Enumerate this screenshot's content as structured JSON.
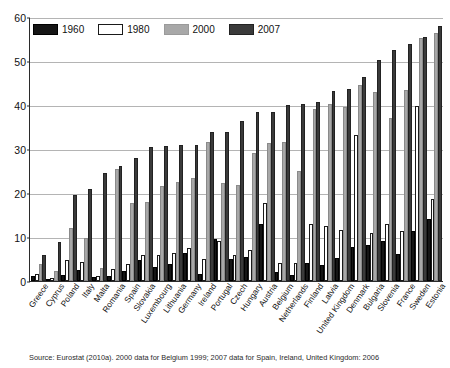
{
  "chart_data": {
    "type": "bar",
    "title": "",
    "subtitle": "",
    "xlabel": "",
    "ylabel": "",
    "ylim": [
      0,
      60
    ],
    "yticks": [
      0,
      10,
      20,
      30,
      40,
      50,
      60
    ],
    "grid": true,
    "legend_position": "top-left",
    "categories": [
      "Greece",
      "Cyprus",
      "Poland",
      "Italy",
      "Malta",
      "Romania",
      "Spain",
      "Slovakia",
      "Luxembourg",
      "Lithuania",
      "Germany",
      "Ireland",
      "Portugal",
      "Czech",
      "Hungary",
      "Austria",
      "Belgium",
      "Netherlands",
      "Finland",
      "Latvia",
      "United Kingdom",
      "Denmark",
      "Bulgaria",
      "Slovenia",
      "France",
      "Sweden",
      "Estonia"
    ],
    "series": [
      {
        "name": "1960",
        "color": "#151515",
        "values": [
          1.2,
          0.5,
          1.4,
          2.4,
          1.0,
          1.1,
          2.3,
          4.7,
          3.2,
          3.8,
          6.3,
          1.6,
          9.5,
          4.9,
          5.5,
          13.0,
          2.1,
          1.4,
          4.0,
          3.6,
          5.2,
          7.8,
          8.2,
          9.1,
          6.1,
          11.3,
          14.0
        ]
      },
      {
        "name": "1980",
        "color": "#ffffff",
        "values": [
          1.5,
          0.6,
          4.8,
          4.3,
          1.2,
          2.8,
          3.9,
          5.8,
          6.0,
          6.3,
          7.6,
          5.0,
          9.2,
          5.8,
          7.1,
          17.8,
          4.2,
          4.1,
          13.0,
          12.5,
          11.5,
          33.2,
          10.8,
          13.0,
          11.4,
          39.7,
          18.6
        ]
      },
      {
        "name": "2000",
        "color": "#a8a8a8",
        "values": [
          3.9,
          2.2,
          12.1,
          9.7,
          3.0,
          25.5,
          17.7,
          18.0,
          21.6,
          22.4,
          23.4,
          31.5,
          22.2,
          21.8,
          29.0,
          31.3,
          31.7,
          24.9,
          39.2,
          40.3,
          39.5,
          44.6,
          42.9,
          37.1,
          43.3,
          55.3,
          56.3
        ]
      },
      {
        "name": "2007",
        "color": "#3a3a3a",
        "values": [
          5.8,
          8.8,
          19.5,
          21.0,
          24.5,
          26.1,
          28.0,
          30.5,
          30.6,
          30.8,
          30.9,
          33.8,
          33.9,
          36.3,
          38.4,
          38.5,
          39.9,
          40.2,
          40.6,
          43.2,
          43.7,
          46.3,
          50.2,
          52.6,
          53.8,
          55.4,
          58.0
        ]
      }
    ]
  },
  "legend": {
    "items": [
      {
        "label": "1960",
        "swatch": "swatch-1960"
      },
      {
        "label": "1980",
        "swatch": "swatch-1980"
      },
      {
        "label": "2000",
        "swatch": "swatch-2000"
      },
      {
        "label": "2007",
        "swatch": "swatch-2007"
      }
    ]
  },
  "source": {
    "note": "Source: Eurostat (2010a). 2000 data for Belgium 1999; 2007 data for Spain, Ireland, United Kingdom: 2006"
  }
}
